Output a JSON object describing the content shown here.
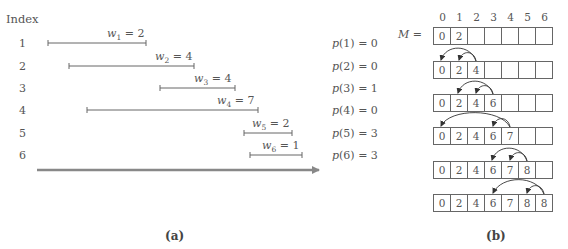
{
  "panel_a": {
    "index_title": "Index",
    "rows": [
      {
        "index": "1",
        "w_sub": "1",
        "weight": "2",
        "p_arg": "1",
        "p_val": "0",
        "start": 48,
        "end": 146,
        "y": 43
      },
      {
        "index": "2",
        "w_sub": "2",
        "weight": "4",
        "p_arg": "2",
        "p_val": "0",
        "start": 69,
        "end": 194,
        "y": 66
      },
      {
        "index": "3",
        "w_sub": "3",
        "weight": "4",
        "p_arg": "3",
        "p_val": "1",
        "start": 160,
        "end": 235,
        "y": 88
      },
      {
        "index": "4",
        "w_sub": "4",
        "weight": "7",
        "p_arg": "4",
        "p_val": "0",
        "start": 87,
        "end": 258,
        "y": 110
      },
      {
        "index": "5",
        "w_sub": "5",
        "weight": "2",
        "p_arg": "5",
        "p_val": "3",
        "start": 244,
        "end": 292,
        "y": 133
      },
      {
        "index": "6",
        "w_sub": "6",
        "weight": "1",
        "p_arg": "6",
        "p_val": "3",
        "start": 250,
        "end": 302,
        "y": 155
      }
    ],
    "time_axis_arrow": {
      "start": 37,
      "end": 325,
      "y": 170,
      "color": "#888888"
    },
    "caption": "(a)"
  },
  "panel_b": {
    "array_label": "M",
    "equals": "=",
    "column_headers": [
      "0",
      "1",
      "2",
      "3",
      "4",
      "5",
      "6"
    ],
    "arrays": [
      {
        "cells": [
          "0",
          "2",
          "",
          "",
          "",
          "",
          ""
        ],
        "top": 27
      },
      {
        "cells": [
          "0",
          "2",
          "4",
          "",
          "",
          "",
          ""
        ],
        "top": 61
      },
      {
        "cells": [
          "0",
          "2",
          "4",
          "6",
          "",
          "",
          ""
        ],
        "top": 94
      },
      {
        "cells": [
          "0",
          "2",
          "4",
          "6",
          "7",
          "",
          ""
        ],
        "top": 127
      },
      {
        "cells": [
          "0",
          "2",
          "4",
          "6",
          "7",
          "8",
          ""
        ],
        "top": 161
      },
      {
        "cells": [
          "0",
          "2",
          "4",
          "6",
          "7",
          "8",
          "8"
        ],
        "top": 194
      }
    ],
    "caption": "(b)"
  },
  "colors": {
    "line": "#666666",
    "text": "#555555",
    "arrow": "#888888"
  }
}
